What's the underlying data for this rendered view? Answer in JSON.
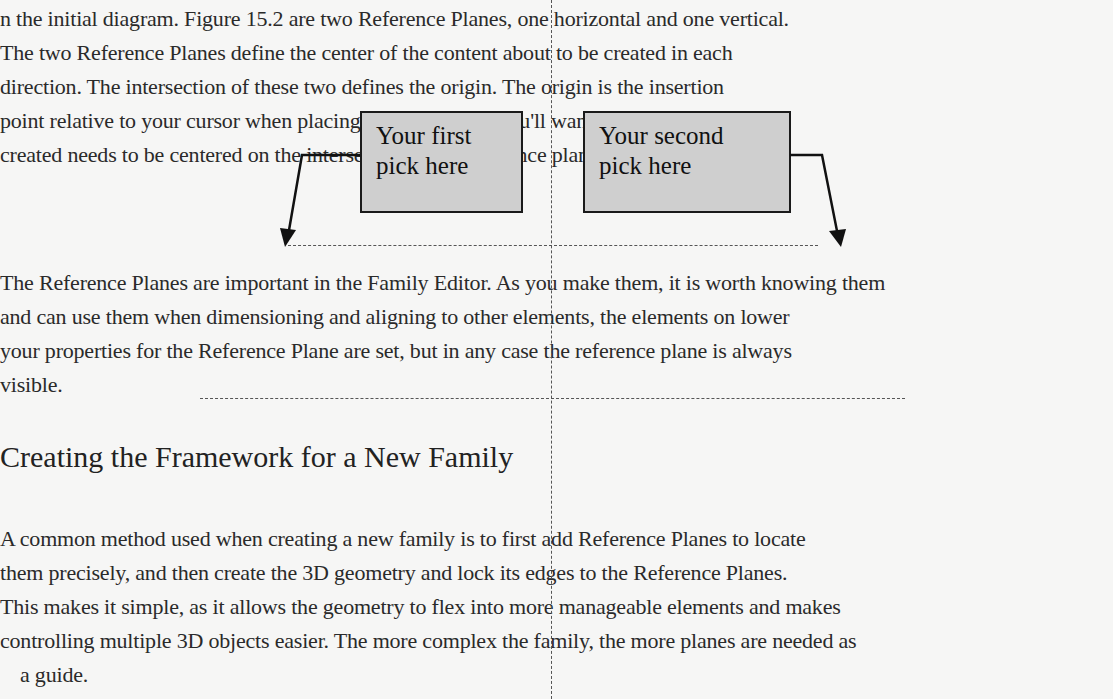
{
  "body_text_top": [
    {
      "text": "in the initial diagram. Figure 15.2 are two Reference Planes, one horizontal and one vertical.",
      "top": 6
    },
    {
      "text": "The two Reference Planes define the center of the content about to be created in each",
      "top": 40
    },
    {
      "text": "direction. The intersection of these two defines the origin. The origin is the insertion",
      "top": 74
    },
    {
      "text": "point relative to your cursor when placing. In most cases, you'll want the box to be",
      "top": 108
    },
    {
      "text": "created needs to be centered on the intersection of the reference planes.",
      "top": 142
    }
  ],
  "figure": {
    "callout_first": {
      "line1": "Your first",
      "line2": "pick here"
    },
    "callout_second": {
      "line1": "Your second",
      "line2": "pick here"
    }
  },
  "body_text_middle": [
    {
      "text": "The Reference Planes are important in the Family Editor. As you make them, it is worth knowing them",
      "top": 270
    },
    {
      "text": "and can use them when dimensioning and aligning to other elements, the elements on lower",
      "top": 304
    },
    {
      "text": "your properties for the Reference Plane are set, but in any case the reference plane is always",
      "top": 338
    },
    {
      "text": "visible.",
      "top": 372
    }
  ],
  "section_heading": "Creating the Framework for a New Family",
  "body_text_bottom": [
    {
      "text": "A common method used when creating a new family is to first add Reference Planes to locate",
      "top": 526
    },
    {
      "text": "them precisely, and then create the 3D geometry and lock its edges to the Reference Planes.",
      "top": 560
    },
    {
      "text": "This makes it simple, as it allows the geometry to flex into more manageable elements and makes",
      "top": 594
    },
    {
      "text": "controlling multiple 3D objects easier. The more complex the family, the more planes are needed as",
      "top": 628
    },
    {
      "text": "a guide.",
      "top": 662
    }
  ],
  "colors": {
    "paper": "#f6f6f5",
    "callout_fill": "#cfcfcf",
    "ink": "#1a1a1a"
  }
}
